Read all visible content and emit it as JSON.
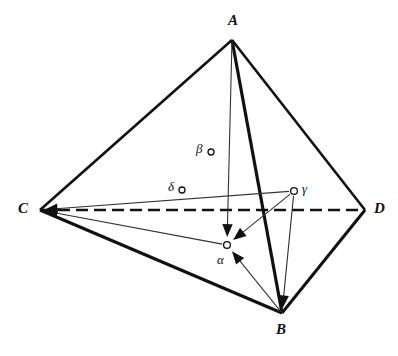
{
  "figure": {
    "canvas": {
      "width": 398,
      "height": 356
    },
    "colors": {
      "stroke": "#111111",
      "thin_stroke": "#333333",
      "background": "#ffffff",
      "node_fill": "#ffffff"
    }
  },
  "vertices": [
    {
      "id": "A",
      "label": "A",
      "x": 232,
      "y": 40,
      "label_x": 228,
      "label_y": 13
    },
    {
      "id": "B",
      "label": "B",
      "x": 282,
      "y": 313,
      "label_x": 276,
      "label_y": 322
    },
    {
      "id": "C",
      "label": "C",
      "x": 40,
      "y": 210,
      "label_x": 18,
      "label_y": 201
    },
    {
      "id": "D",
      "label": "D",
      "x": 365,
      "y": 210,
      "label_x": 374,
      "label_y": 201
    }
  ],
  "interior_points": [
    {
      "id": "alpha",
      "label": "α",
      "x": 227,
      "y": 245,
      "label_x": 217,
      "label_y": 253,
      "radius": 3.4
    },
    {
      "id": "beta",
      "label": "β",
      "x": 211,
      "y": 152,
      "label_x": 196,
      "label_y": 142,
      "radius": 3.0
    },
    {
      "id": "gamma",
      "label": "γ",
      "x": 294,
      "y": 191,
      "label_x": 302,
      "label_y": 182,
      "radius": 3.4
    },
    {
      "id": "delta",
      "label": "δ",
      "x": 182,
      "y": 190,
      "label_x": 168,
      "label_y": 180,
      "radius": 3.0
    }
  ],
  "edges": [
    {
      "id": "edge-AC",
      "from": "A",
      "to": "C",
      "style": "solid",
      "weight": 2.6
    },
    {
      "id": "edge-AD",
      "from": "A",
      "to": "D",
      "style": "solid",
      "weight": 2.6
    },
    {
      "id": "edge-AB",
      "from": "A",
      "to": "B",
      "style": "solid",
      "weight": 3.2
    },
    {
      "id": "edge-CB",
      "from": "C",
      "to": "B",
      "style": "solid",
      "weight": 3.0
    },
    {
      "id": "edge-DB",
      "from": "D",
      "to": "B",
      "style": "solid",
      "weight": 3.0
    },
    {
      "id": "edge-CD",
      "from": "C",
      "to": "D",
      "style": "dashed",
      "weight": 2.4,
      "dash": "12 6"
    }
  ],
  "arrows": [
    {
      "id": "arrow-A-alpha",
      "from": "A",
      "to": "alpha",
      "weight": 1.1
    },
    {
      "id": "arrow-gamma-alpha",
      "from": "gamma",
      "to": "alpha",
      "weight": 1.1
    },
    {
      "id": "arrow-B-alpha",
      "from": "B",
      "to": "alpha",
      "weight": 1.1
    },
    {
      "id": "arrow-alpha-C",
      "from": "alpha",
      "to": "C",
      "weight": 1.1
    },
    {
      "id": "arrow-gamma-B",
      "from": "gamma",
      "to": "B",
      "weight": 1.1
    },
    {
      "id": "arrow-gamma-C",
      "from": "gamma",
      "to": "C",
      "weight": 1.1
    }
  ]
}
